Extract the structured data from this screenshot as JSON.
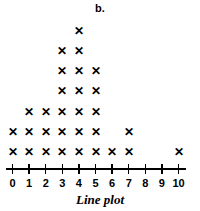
{
  "panel": {
    "label": "b."
  },
  "caption": {
    "text": "Line plot"
  },
  "axis": {
    "tick_labels": [
      "0",
      "1",
      "2",
      "3",
      "4",
      "5",
      "6",
      "7",
      "8",
      "9",
      "10"
    ],
    "color": "#000000"
  },
  "mark": {
    "glyph": "✕",
    "color": "#000000"
  },
  "chart_data": {
    "type": "bar",
    "title": "Line plot",
    "subtitle": "b.",
    "xlabel": "Line plot",
    "ylabel": "",
    "categories": [
      "0",
      "1",
      "2",
      "3",
      "4",
      "5",
      "6",
      "7",
      "8",
      "9",
      "10"
    ],
    "values": [
      2,
      3,
      3,
      6,
      7,
      5,
      1,
      2,
      0,
      0,
      1
    ],
    "series": [
      {
        "name": "Frequency",
        "values": [
          2,
          3,
          3,
          6,
          7,
          5,
          1,
          2,
          0,
          0,
          1
        ]
      }
    ],
    "xlim": [
      0,
      10
    ],
    "ylim": [
      0,
      7
    ],
    "grid": false,
    "legend": "none",
    "marker": "✕"
  }
}
